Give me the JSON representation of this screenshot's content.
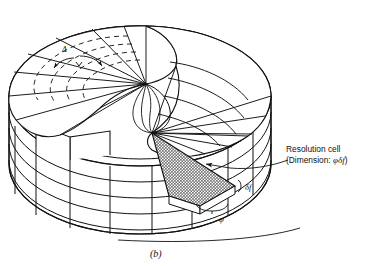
{
  "figure": {
    "caption": "(b)",
    "kind": "radar-resolution-cell-3d-diagram",
    "background_color": "#ffffff",
    "line_color": "#111111",
    "shaded_cell_color": "#b4b4b4"
  },
  "annotations": {
    "resolution_cell": {
      "line1": "Resolution cell",
      "line2_prefix": "(Dimension: ",
      "line2_symbols": "φδf",
      "line2_suffix": ")"
    },
    "delta_f": "δf",
    "phi": "φ",
    "theta": "Δ"
  },
  "geometry": {
    "top_ellipse": {
      "center_x": 140,
      "center_y": 96,
      "radius_x": 131,
      "radius_y": 70
    },
    "cylinder_height": 68,
    "side_bands": 4,
    "radial_sectors": 16,
    "range_rings_dashed": 4,
    "helicoid_apex_upper": {
      "x": 146,
      "y": 84
    },
    "helicoid_apex_lower": {
      "x": 152,
      "y": 133
    }
  }
}
